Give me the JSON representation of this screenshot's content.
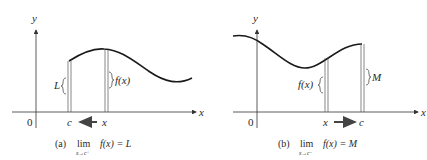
{
  "panels": [
    {
      "id": "a",
      "axis_labels": {
        "x": "x",
        "y": "y",
        "origin": "0"
      },
      "point_labels": {
        "left": "c",
        "right": "x"
      },
      "bracket_labels": {
        "left": "L",
        "right": "f(x)"
      },
      "arrow_direction": "left",
      "caption": {
        "tag": "(a)",
        "lim": "lim",
        "subscript": "x→c⁺",
        "expression": "f(x) = L"
      }
    },
    {
      "id": "b",
      "axis_labels": {
        "x": "x",
        "y": "y",
        "origin": "0"
      },
      "point_labels": {
        "left": "x",
        "right": "c"
      },
      "bracket_labels": {
        "left": "f(x)",
        "right": "M"
      },
      "arrow_direction": "right",
      "caption": {
        "tag": "(b)",
        "lim": "lim",
        "subscript": "x→c⁻",
        "expression": "f(x) = M"
      }
    }
  ],
  "colors": {
    "curve": "#1a1a1a",
    "axis": "#333333",
    "guide": "#555555",
    "text": "#2a2a2a"
  }
}
